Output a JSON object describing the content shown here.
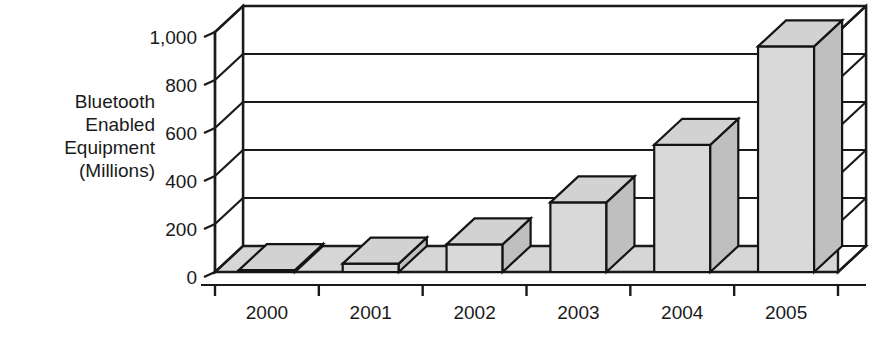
{
  "chart_data": {
    "type": "bar",
    "title": "",
    "subtitle": "",
    "xlabel": "",
    "ylabel": "Bluetooth Enabled Equipment (Millions)",
    "ylabel_lines": [
      "Bluetooth",
      "Enabled",
      "Equipment",
      "(Millions)"
    ],
    "categories": [
      "2000",
      "2001",
      "2002",
      "2003",
      "2004",
      "2005"
    ],
    "values": [
      8,
      35,
      115,
      290,
      530,
      940
    ],
    "series": [
      {
        "name": "Bluetooth Enabled Equipment",
        "values": [
          8,
          35,
          115,
          290,
          530,
          940
        ]
      }
    ],
    "ylim": [
      0,
      1000
    ],
    "yticks": [
      0,
      200,
      400,
      600,
      800,
      1000
    ],
    "ytick_labels": [
      "0",
      "200",
      "400",
      "600",
      "800",
      "1,000"
    ],
    "grid": true,
    "legend": false,
    "legend_position": "none",
    "style": "3d-column",
    "colors": {
      "bar_front": "#d9d9d9",
      "bar_side": "#bfbfbf",
      "bar_top": "#d2d2d2",
      "outline": "#141414",
      "floor": "#d6d6d6",
      "background": "#ffffff",
      "text": "#1a1a1a"
    }
  }
}
